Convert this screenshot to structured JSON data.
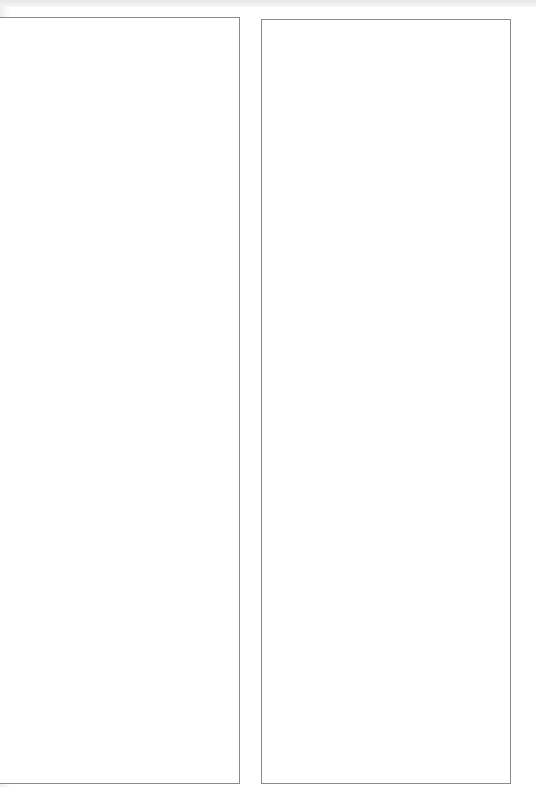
{
  "page": {
    "background": "#ffffff",
    "border_color": "#8a8a8a"
  },
  "panels": [
    {
      "id": "left",
      "content": ""
    },
    {
      "id": "right",
      "content": ""
    }
  ]
}
